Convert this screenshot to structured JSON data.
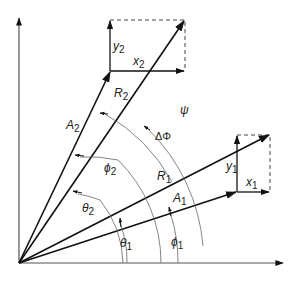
{
  "diagram": {
    "title": "",
    "vectors": [
      {
        "id": "A2",
        "label": "A",
        "sub": "2"
      },
      {
        "id": "R2",
        "label": "R",
        "sub": "2"
      },
      {
        "id": "A1",
        "label": "A",
        "sub": "1"
      },
      {
        "id": "R1",
        "label": "R",
        "sub": "1"
      }
    ],
    "components": [
      {
        "id": "y2",
        "label": "y",
        "sub": "2"
      },
      {
        "id": "x2",
        "label": "x",
        "sub": "2"
      },
      {
        "id": "y1",
        "label": "y",
        "sub": "1"
      },
      {
        "id": "x1",
        "label": "x",
        "sub": "1"
      }
    ],
    "angles": [
      {
        "id": "psi",
        "label": "ψ",
        "sub": ""
      },
      {
        "id": "delta_phi",
        "label": "ΔΦ",
        "sub": ""
      },
      {
        "id": "phi2",
        "label": "ϕ",
        "sub": "2"
      },
      {
        "id": "theta2",
        "label": "θ",
        "sub": "2"
      },
      {
        "id": "theta1",
        "label": "θ",
        "sub": "1"
      },
      {
        "id": "phi1",
        "label": "ϕ",
        "sub": "1"
      }
    ],
    "colors": {
      "line": "#111111",
      "arc": "#666666",
      "background": "#ffffff"
    }
  }
}
